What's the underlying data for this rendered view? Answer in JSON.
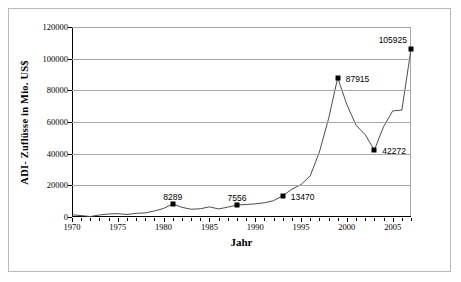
{
  "chart_data": {
    "type": "line",
    "title": "",
    "xlabel": "Jahr",
    "ylabel": "ADI- Zuflüsse in Mio. US$",
    "xlim": [
      1970,
      2007
    ],
    "ylim": [
      0,
      120000
    ],
    "ytick_labels": [
      "120000",
      "100000",
      "80000",
      "60000",
      "40000",
      "20000",
      "0"
    ],
    "ytick_values": [
      120000,
      100000,
      80000,
      60000,
      40000,
      20000,
      0
    ],
    "xtick_labels": [
      "1970",
      "1975",
      "1980",
      "1985",
      "1990",
      "1995",
      "2000",
      "2005"
    ],
    "xtick_values": [
      1970,
      1975,
      1980,
      1985,
      1990,
      1995,
      2000,
      2005
    ],
    "grid": true,
    "legend": "none",
    "series": [
      {
        "name": "ADI-Zuflüsse",
        "x": [
          1970,
          1971,
          1972,
          1973,
          1974,
          1975,
          1976,
          1977,
          1978,
          1979,
          1980,
          1981,
          1982,
          1983,
          1984,
          1985,
          1986,
          1987,
          1988,
          1989,
          1990,
          1991,
          1992,
          1993,
          1994,
          1995,
          1996,
          1997,
          1998,
          1999,
          2000,
          2001,
          2002,
          2003,
          2004,
          2005,
          2006,
          2007
        ],
        "values": [
          1400,
          900,
          300,
          1300,
          1900,
          2100,
          1600,
          2300,
          2600,
          3800,
          5400,
          8289,
          6100,
          4900,
          5200,
          6400,
          5100,
          6200,
          7556,
          7900,
          8300,
          9000,
          10300,
          13470,
          17500,
          20500,
          26000,
          41000,
          62000,
          87915,
          71000,
          58000,
          52000,
          42272,
          57000,
          67000,
          67500,
          105925
        ]
      }
    ],
    "data_labels": [
      {
        "year": 1981,
        "value": 8289,
        "text": "8289"
      },
      {
        "year": 1988,
        "value": 7556,
        "text": "7556"
      },
      {
        "year": 1993,
        "value": 13470,
        "text": "13470"
      },
      {
        "year": 1999,
        "value": 87915,
        "text": "87915"
      },
      {
        "year": 2003,
        "value": 42272,
        "text": "42272"
      },
      {
        "year": 2007,
        "value": 105925,
        "text": "105925"
      }
    ],
    "colors": {
      "line": "#4d4d4d",
      "marker": "#000000",
      "gridline": "#a6a6a6",
      "axis": "#000000",
      "background": "#ffffff",
      "border": "#b9b9b9"
    }
  }
}
